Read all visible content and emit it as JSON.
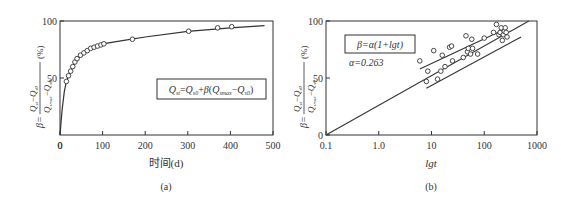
{
  "chart_data": [
    {
      "panel_label": "(a)",
      "type": "line",
      "title": "",
      "xlabel": "时间(d)",
      "ylabel": "β = (Q_st − Q_s0)/(Q_smax − Q_s0) (%)",
      "xlim": [
        0,
        500
      ],
      "ylim": [
        0,
        100
      ],
      "x_ticks": [
        "0",
        "100",
        "200",
        "300",
        "400",
        "500"
      ],
      "y_ticks": [
        "50",
        "100"
      ],
      "grid": false,
      "annotation": "Q_st = Q_s0 + β(Q_smax − Q_s0)",
      "series": [
        {
          "name": "measured",
          "marker": "circle-open",
          "x": [
            15,
            20,
            25,
            30,
            35,
            40,
            48,
            56,
            64,
            72,
            80,
            88,
            96,
            103,
            170,
            302,
            370,
            403
          ],
          "y": [
            47,
            52,
            56,
            60,
            64,
            67,
            70,
            72,
            74,
            76,
            77,
            78,
            79,
            80,
            84,
            91,
            94,
            95
          ]
        },
        {
          "name": "fit",
          "marker": "none",
          "x": [
            0,
            5,
            10,
            15,
            20,
            30,
            40,
            60,
            80,
            100,
            150,
            200,
            300,
            400,
            480
          ],
          "y": [
            0,
            22,
            38,
            47,
            52,
            60,
            66,
            73,
            77,
            80,
            83,
            86,
            91,
            94,
            96
          ]
        }
      ]
    },
    {
      "panel_label": "(b)",
      "type": "scatter",
      "title": "",
      "xlabel": "lgt",
      "ylabel": "β = (Q_st − Q_s0)/(Q_smax − Q_s0) (%)",
      "xscale": "log",
      "xlim": [
        0.1,
        1000
      ],
      "ylim": [
        0,
        100
      ],
      "x_ticks": [
        "0.1",
        "1.0",
        "10",
        "100",
        "1000"
      ],
      "y_ticks": [
        "0",
        "50",
        "100"
      ],
      "grid": false,
      "annotation_box": "β = α(1+lgt)",
      "annotation_text": "α=0.263",
      "series": [
        {
          "name": "measured",
          "marker": "circle-open",
          "x": [
            6,
            8,
            8.5,
            11,
            13,
            15,
            16,
            18,
            22,
            24,
            25,
            40,
            45,
            48,
            50,
            55,
            58,
            60,
            75,
            100,
            150,
            170,
            190,
            200,
            210,
            220,
            230,
            240,
            250,
            260,
            270
          ],
          "y": [
            65,
            47,
            56,
            74,
            49,
            56,
            70,
            60,
            77,
            78,
            65,
            68,
            87,
            73,
            76,
            71,
            84,
            76,
            71,
            85,
            90,
            97,
            88,
            90,
            94,
            83,
            88,
            91,
            94,
            90,
            86
          ]
        },
        {
          "name": "fit β=α(1+lgt)",
          "marker": "none",
          "x": [
            0.1,
            700
          ],
          "y": [
            0,
            100
          ]
        },
        {
          "name": "upper bound",
          "marker": "none",
          "x": [
            6,
            250
          ],
          "y": [
            58,
            93
          ]
        },
        {
          "name": "lower bound",
          "marker": "none",
          "x": [
            8,
            500
          ],
          "y": [
            41,
            86
          ]
        }
      ]
    }
  ],
  "panels": {
    "a": {
      "label": "(a)",
      "xlabel": "时间(d)",
      "x_ticks": [
        "0",
        "100",
        "200",
        "300",
        "400",
        "500"
      ],
      "y_ticks": [
        "50",
        "100"
      ],
      "ylabel_prefix": "β=",
      "ylabel_num": "Q",
      "ylabel_unit": "(%)",
      "formula": "Q",
      "formula_parts": [
        "Q",
        "st",
        "=Q",
        "s0",
        "+β(Q",
        "smax",
        "−Q",
        "s0",
        ")"
      ]
    },
    "b": {
      "label": "(b)",
      "xlabel": "lgt",
      "x_ticks": [
        "0.1",
        "1.0",
        "10",
        "100",
        "1000"
      ],
      "y_ticks": [
        "0",
        "50",
        "100"
      ],
      "formula_box": "β=α(1+lgt)",
      "alpha_text": "α=0.263"
    }
  },
  "colors": {
    "line": "#333333",
    "text": "#333333",
    "background": "#ffffff"
  }
}
